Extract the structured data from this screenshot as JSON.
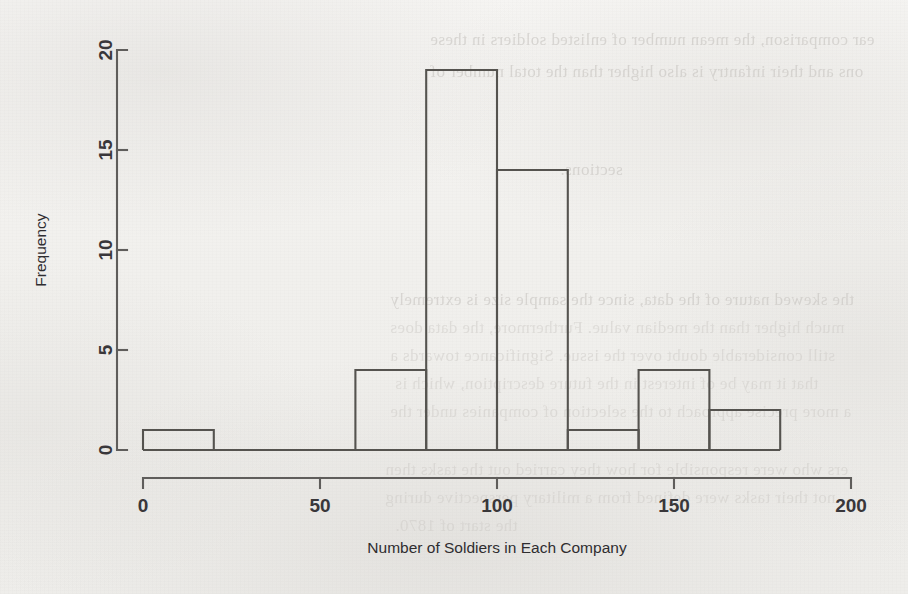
{
  "page": {
    "background_color": "#f2f1ef",
    "ink_color": "#55534f",
    "ghost_text_color": "#c9c6c2",
    "ghost_lines": [
      "ear comparison, the mean number of enlisted soldiers in these",
      "ons and their infantry is also higher than the total number of",
      "sections.",
      "the skewed nature of the data, since the sample size is extremely",
      "much higher than the median value. Furthermore, the data does",
      "still considerable doubt over the issue. Significance towards a",
      "that it may be of interest in the future description, which is",
      "a more precise approach to the selection of companies under the",
      "ers who were responsible for how they carried out the tasks then",
      "not their tasks were defined from a military perspective during",
      "the start of 1870."
    ]
  },
  "chart_data": {
    "type": "bar",
    "title": "",
    "subtitle": "",
    "xlabel": "Number of Soldiers in Each Company",
    "ylabel": "Frequency",
    "grid": false,
    "legend": "none",
    "bin_width": 20,
    "bin_edges": [
      0,
      20,
      40,
      60,
      80,
      100,
      120,
      140,
      160,
      180
    ],
    "categories": [
      "0-20",
      "20-40",
      "40-60",
      "60-80",
      "80-100",
      "100-120",
      "120-140",
      "140-160",
      "160-180"
    ],
    "values": [
      1,
      0,
      0,
      4,
      19,
      14,
      1,
      4,
      2
    ],
    "xlim": [
      0,
      200
    ],
    "ylim": [
      0,
      20
    ],
    "xticks": [
      0,
      50,
      100,
      150,
      200
    ],
    "xtick_labels": [
      "0",
      "50",
      "100",
      "150",
      "200"
    ],
    "yticks": [
      0,
      5,
      10,
      15,
      20
    ],
    "ytick_labels": [
      "0",
      "5",
      "10",
      "15",
      "20"
    ]
  }
}
